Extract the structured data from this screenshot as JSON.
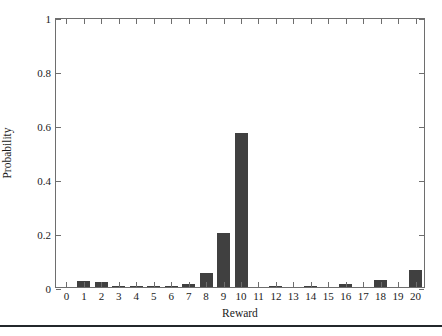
{
  "chart_data": {
    "type": "bar",
    "title": "",
    "xlabel": "Reward",
    "ylabel": "Probability",
    "categories": [
      "0",
      "1",
      "2",
      "3",
      "4",
      "5",
      "6",
      "7",
      "8",
      "9",
      "10",
      "11",
      "12",
      "13",
      "14",
      "15",
      "16",
      "17",
      "18",
      "19",
      "20"
    ],
    "values": [
      0.0,
      0.022,
      0.019,
      0.004,
      0.002,
      0.004,
      0.002,
      0.012,
      0.053,
      0.201,
      0.57,
      0.0,
      0.002,
      0.0,
      0.004,
      0.0,
      0.012,
      0.0,
      0.027,
      0.0,
      0.062
    ],
    "xlim": [
      -0.6,
      20.6
    ],
    "ylim": [
      0,
      1
    ],
    "yticks": [
      0,
      0.2,
      0.4,
      0.6,
      0.8,
      1
    ],
    "ytick_labels": [
      "0",
      "0.2",
      "0.4",
      "0.6",
      "0.8",
      "1"
    ],
    "xticks": [
      0,
      1,
      2,
      3,
      4,
      5,
      6,
      7,
      8,
      9,
      10,
      11,
      12,
      13,
      14,
      15,
      16,
      17,
      18,
      19,
      20
    ],
    "grid": false,
    "legend": null,
    "bar_color": "#404040",
    "axis_color": "#6e6e6e",
    "background_color": "#ffffff"
  },
  "figure": {
    "bottom_rule_color": "#23272b"
  }
}
